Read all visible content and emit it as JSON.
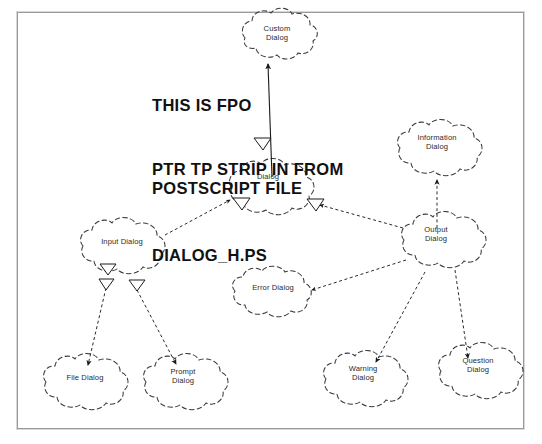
{
  "document": {
    "kind": "scanned-diagram",
    "border_color": "#9a9a9a",
    "background_color": "#ffffff",
    "ink_color": "#2b2b2b"
  },
  "overlay_text": {
    "line_1": "THIS IS FPO",
    "line_2": "PTR TP STRIP IN FROM\nPOSTSCRIPT FILE",
    "line_3": "DIALOG_H.PS"
  },
  "diagram": {
    "type": "cloud-node-hierarchy",
    "nodes": [
      {
        "id": "custom",
        "label": "Custom\nDialog",
        "x": 277,
        "y": 35,
        "w": 72,
        "h": 46
      },
      {
        "id": "dialog",
        "label": "Dialog",
        "x": 268,
        "y": 183,
        "w": 84,
        "h": 44
      },
      {
        "id": "information",
        "label": "Information\nDialog",
        "x": 437,
        "y": 144,
        "w": 82,
        "h": 46
      },
      {
        "id": "input",
        "label": "Input Dialog",
        "x": 122,
        "y": 241,
        "w": 86,
        "h": 44
      },
      {
        "id": "output",
        "label": "Output\nDialog",
        "x": 436,
        "y": 236,
        "w": 76,
        "h": 46
      },
      {
        "id": "error",
        "label": "Error Dialog",
        "x": 273,
        "y": 287,
        "w": 84,
        "h": 42
      },
      {
        "id": "file",
        "label": "File Dialog",
        "x": 85,
        "y": 378,
        "w": 84,
        "h": 46
      },
      {
        "id": "prompt",
        "label": "Prompt\nDialog",
        "x": 183,
        "y": 378,
        "w": 80,
        "h": 48
      },
      {
        "id": "warning",
        "label": "Warning\nDialog",
        "x": 363,
        "y": 375,
        "w": 78,
        "h": 48
      },
      {
        "id": "question",
        "label": "Question\nDialog",
        "x": 478,
        "y": 367,
        "w": 78,
        "h": 48
      }
    ],
    "edges": [
      {
        "from": "dialog",
        "to": "custom",
        "style": "solid",
        "arrow": "filled"
      },
      {
        "from": "output",
        "to": "information",
        "style": "dashed",
        "arrow": "filled"
      },
      {
        "from": "input",
        "to": "dialog",
        "style": "dashed",
        "arrow": "filled"
      },
      {
        "from": "output",
        "to": "dialog",
        "style": "dashed",
        "arrow": "filled"
      },
      {
        "from": "error",
        "to": "output",
        "style": "dashed",
        "arrow": "filled"
      },
      {
        "from": "input",
        "to": "file",
        "style": "dashed",
        "arrow": "filled"
      },
      {
        "from": "input",
        "to": "prompt",
        "style": "dashed",
        "arrow": "filled"
      },
      {
        "from": "output",
        "to": "warning",
        "style": "dashed",
        "arrow": "filled"
      },
      {
        "from": "output",
        "to": "question",
        "style": "dashed",
        "arrow": "filled"
      }
    ],
    "markers": [
      {
        "name": "hollow-triangle",
        "x": 107,
        "y": 268
      },
      {
        "name": "hollow-triangle",
        "x": 106,
        "y": 283
      },
      {
        "name": "hollow-triangle",
        "x": 136,
        "y": 284
      },
      {
        "name": "hollow-triangle",
        "x": 241,
        "y": 203
      },
      {
        "name": "hollow-triangle",
        "x": 315,
        "y": 204
      },
      {
        "name": "hollow-triangle",
        "x": 262,
        "y": 143
      }
    ]
  }
}
